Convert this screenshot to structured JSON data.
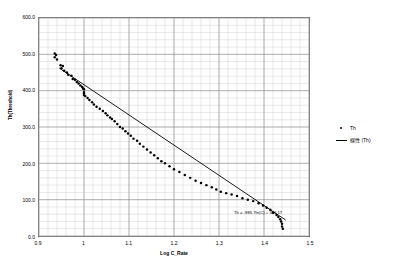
{
  "chart_data": {
    "type": "scatter",
    "title": "",
    "xlabel": "Log C_Rate",
    "ylabel": "Th(Threshold)",
    "xlim": [
      0.9,
      1.5
    ],
    "ylim": [
      0.0,
      600.0
    ],
    "xticks": [
      "0.9",
      "1",
      "1.1",
      "1.2",
      "1.3",
      "1.4",
      "1.5"
    ],
    "xtick_values": [
      0.9,
      1.0,
      1.1,
      1.2,
      1.3,
      1.4,
      1.5
    ],
    "yticks": [
      "600.0",
      "500.0",
      "400.0",
      "300.0",
      "200.0",
      "100.0",
      "0.0"
    ],
    "ytick_values": [
      600,
      500,
      400,
      300,
      200,
      100,
      0
    ],
    "grid": "major and minor gridlines, light gray",
    "minor_x_step": 0.02,
    "minor_y_step": 20,
    "legend_position": "right",
    "annotation": "Th = -985.7ln(C) + 386.17",
    "series": [
      {
        "name": "Th",
        "marker": "dot",
        "color": "#000000",
        "points": [
          [
            0.935,
            502
          ],
          [
            0.935,
            492
          ],
          [
            0.938,
            498
          ],
          [
            0.94,
            486
          ],
          [
            0.948,
            470
          ],
          [
            0.95,
            462
          ],
          [
            0.953,
            468
          ],
          [
            0.956,
            455
          ],
          [
            0.962,
            450
          ],
          [
            0.965,
            444
          ],
          [
            0.972,
            441
          ],
          [
            0.975,
            432
          ],
          [
            0.98,
            430
          ],
          [
            0.984,
            424
          ],
          [
            0.988,
            420
          ],
          [
            0.992,
            414
          ],
          [
            0.996,
            410
          ],
          [
            0.998,
            406
          ],
          [
            1.0,
            404
          ],
          [
            1.0,
            396
          ],
          [
            1.0,
            392
          ],
          [
            1.0,
            388
          ],
          [
            1.003,
            385
          ],
          [
            1.008,
            380
          ],
          [
            1.012,
            374
          ],
          [
            1.018,
            368
          ],
          [
            1.022,
            362
          ],
          [
            1.028,
            356
          ],
          [
            1.035,
            350
          ],
          [
            1.042,
            344
          ],
          [
            1.048,
            338
          ],
          [
            1.052,
            332
          ],
          [
            1.058,
            326
          ],
          [
            1.062,
            322
          ],
          [
            1.068,
            316
          ],
          [
            1.074,
            308
          ],
          [
            1.08,
            300
          ],
          [
            1.086,
            296
          ],
          [
            1.092,
            288
          ],
          [
            1.098,
            282
          ],
          [
            1.104,
            276
          ],
          [
            1.11,
            268
          ],
          [
            1.118,
            262
          ],
          [
            1.124,
            254
          ],
          [
            1.132,
            246
          ],
          [
            1.14,
            238
          ],
          [
            1.148,
            230
          ],
          [
            1.156,
            222
          ],
          [
            1.164,
            214
          ],
          [
            1.172,
            206
          ],
          [
            1.18,
            200
          ],
          [
            1.19,
            192
          ],
          [
            1.2,
            184
          ],
          [
            1.212,
            176
          ],
          [
            1.224,
            168
          ],
          [
            1.236,
            160
          ],
          [
            1.248,
            152
          ],
          [
            1.26,
            146
          ],
          [
            1.272,
            140
          ],
          [
            1.284,
            134
          ],
          [
            1.294,
            128
          ],
          [
            1.304,
            122
          ],
          [
            1.316,
            118
          ],
          [
            1.328,
            114
          ],
          [
            1.34,
            110
          ],
          [
            1.352,
            104
          ],
          [
            1.364,
            100
          ],
          [
            1.376,
            96
          ],
          [
            1.388,
            90
          ],
          [
            1.398,
            84
          ],
          [
            1.406,
            78
          ],
          [
            1.414,
            72
          ],
          [
            1.42,
            64
          ],
          [
            1.428,
            58
          ],
          [
            1.432,
            52
          ],
          [
            1.436,
            46
          ],
          [
            1.438,
            40
          ],
          [
            1.44,
            34
          ],
          [
            1.44,
            26
          ],
          [
            1.442,
            20
          ]
        ]
      }
    ],
    "trendline": {
      "name": "Linear (Th)",
      "color": "#000000",
      "x_start": 0.945,
      "y_start": 462,
      "x_end": 1.448,
      "y_end": 44
    }
  },
  "legend": {
    "entries": [
      {
        "label": "Th",
        "marker": "dot"
      },
      {
        "label": "線性 (Th)",
        "marker": "line"
      }
    ]
  },
  "axes": {
    "y_title": "Th(Threshold)",
    "x_title": "Log C_Rate",
    "y_labels": [
      "600.0",
      "500.0",
      "400.0",
      "300.0",
      "200.0",
      "100.0",
      "0.0"
    ],
    "x_labels": [
      "0.9",
      "1",
      "1.1",
      "1.2",
      "1.3",
      "1.4",
      "1.5"
    ]
  },
  "annotation": {
    "equation": "Th = -985.7ln(C) + 386.17"
  }
}
